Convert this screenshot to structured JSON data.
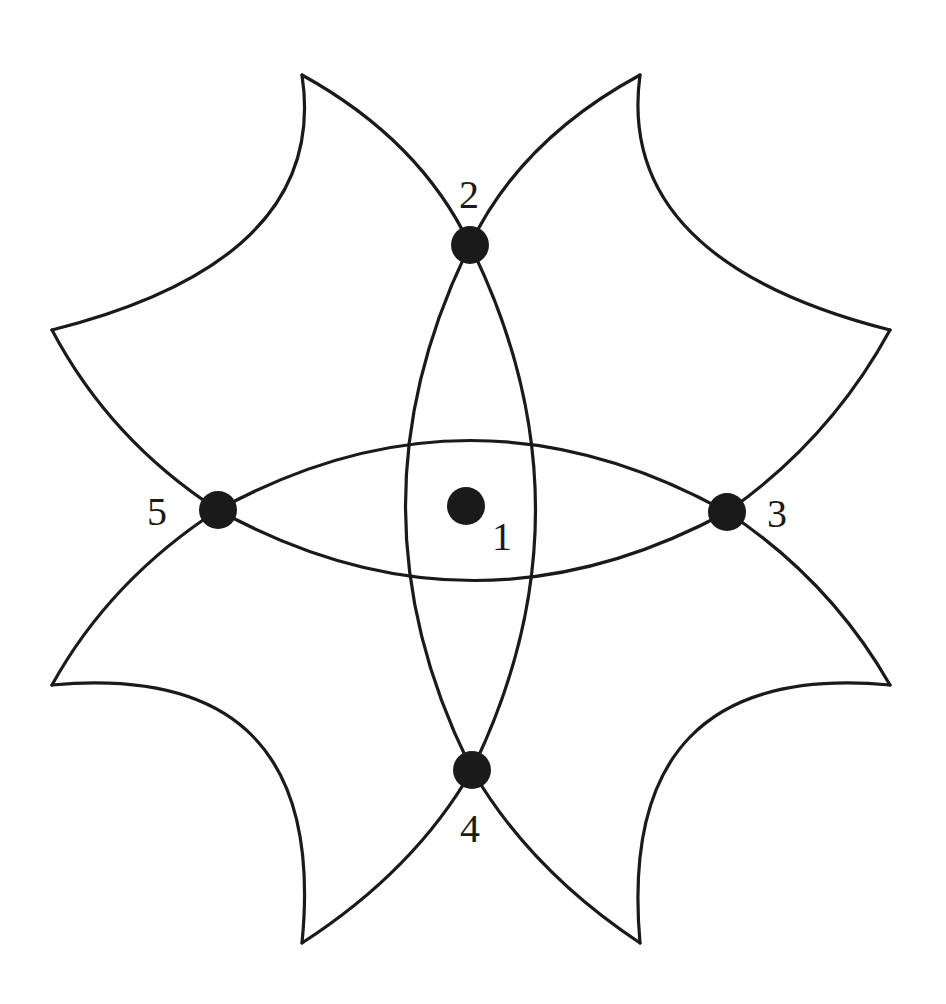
{
  "figure": {
    "stroke_color": "#1a1a1a",
    "background_color": "#ffffff",
    "nodes": [
      {
        "id": "1",
        "label": "1",
        "x": 466,
        "y": 506,
        "position": "center"
      },
      {
        "id": "2",
        "label": "2",
        "x": 470,
        "y": 245,
        "position": "top"
      },
      {
        "id": "3",
        "label": "3",
        "x": 727,
        "y": 512,
        "position": "right"
      },
      {
        "id": "4",
        "label": "4",
        "x": 472,
        "y": 770,
        "position": "bottom"
      },
      {
        "id": "5",
        "label": "5",
        "x": 218,
        "y": 510,
        "position": "left"
      }
    ],
    "outer_tips": [
      {
        "x": 302,
        "y": 75
      },
      {
        "x": 640,
        "y": 75
      },
      {
        "x": 890,
        "y": 330
      },
      {
        "x": 890,
        "y": 685
      },
      {
        "x": 640,
        "y": 943
      },
      {
        "x": 302,
        "y": 943
      },
      {
        "x": 52,
        "y": 685
      },
      {
        "x": 52,
        "y": 330
      }
    ]
  }
}
